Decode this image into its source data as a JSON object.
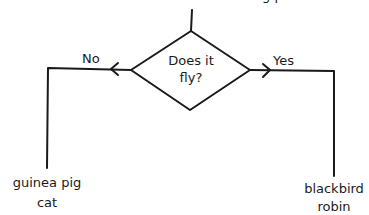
{
  "diagram": {
    "type": "flowchart-decision",
    "top_clipped_text": "g p",
    "decision": {
      "line1": "Does it",
      "line2": "fly?"
    },
    "branches": {
      "no": {
        "label": "No",
        "items": [
          "guinea pig",
          "cat"
        ]
      },
      "yes": {
        "label": "Yes",
        "items": [
          "blackbird",
          "robin"
        ]
      }
    },
    "colors": {
      "stroke": "#1a1a1a",
      "background": "#ffffff"
    }
  }
}
